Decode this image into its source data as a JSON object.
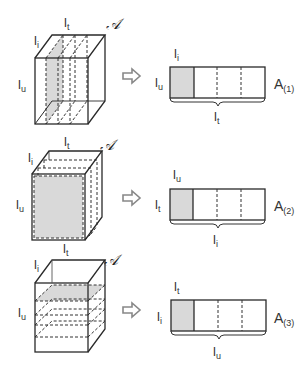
{
  "panels": [
    {
      "id": 1,
      "cube": {
        "labels": {
          "top": "l_t",
          "left_top": "l_i",
          "left": "l_u",
          "corner": "𝒜"
        },
        "slicing": "vertical slices along l_t (front-to-back dashed planes)",
        "shaded_slice": "first vertical slice"
      },
      "arrow": "⇨",
      "matrix": {
        "name": "A(1)",
        "name_base": "A",
        "name_sub": "(1)",
        "label_top": "l_i",
        "label_left": "l_u",
        "label_bottom": "l_t",
        "columns": 4,
        "shaded_column": 0
      }
    },
    {
      "id": 2,
      "cube": {
        "labels": {
          "top": "l_t",
          "left_top": "l_i",
          "left": "l_u",
          "bottom": "l_t",
          "corner": "𝒜"
        },
        "slicing": "frontal slices along l_i",
        "shaded_slice": "front face"
      },
      "arrow": "⇨",
      "matrix": {
        "name": "A(2)",
        "name_base": "A",
        "name_sub": "(2)",
        "label_top": "l_u",
        "label_left": "l_t",
        "label_bottom": "l_i",
        "columns": 4,
        "shaded_column": 0
      }
    },
    {
      "id": 3,
      "cube": {
        "labels": {
          "top": "l_t",
          "left_top": "l_i",
          "left": "l_u",
          "corner": "𝒜"
        },
        "slicing": "horizontal slices along l_u",
        "shaded_slice": "top horizontal slice"
      },
      "arrow": "⇨",
      "matrix": {
        "name": "A(3)",
        "name_base": "A",
        "name_sub": "(3)",
        "label_top": "l_t",
        "label_left": "l_i",
        "label_bottom": "l_u",
        "columns": 4,
        "shaded_column": 0
      }
    }
  ],
  "text": {
    "l": "l",
    "t": "t",
    "i": "i",
    "u": "u",
    "A": "A",
    "sub1": "(1)",
    "sub2": "(2)",
    "sub3": "(3)",
    "calA": "𝒜"
  },
  "colors": {
    "line": "#2a2a2a",
    "shade": "#d9d9d9",
    "arrow": "#888888"
  }
}
